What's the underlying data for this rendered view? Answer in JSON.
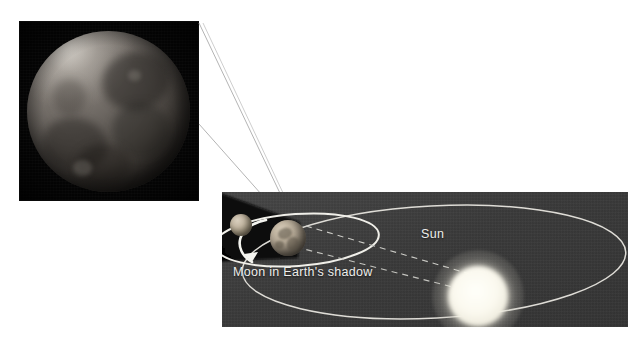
{
  "figure": {
    "background_color": "#ffffff"
  },
  "photo": {
    "name": "eclipsed-moon-photograph",
    "subject": "Moon during total lunar eclipse",
    "background_color": "#050505",
    "disc_color": "#6d675f",
    "alt_text": "Photograph of the Moon darkened inside Earth's shadow"
  },
  "leader_lines": {
    "name": "callout-leader-lines",
    "color": "#b9b9b9",
    "count": 2,
    "description": "Lines connecting the photograph to the Moon in Earth's shadow in the diagram"
  },
  "diagram": {
    "name": "orbit-diagram",
    "background_color": "#3b3b3b",
    "labels": [
      {
        "id": "sun",
        "text": "Sun",
        "color": "#ededea"
      },
      {
        "id": "moon-shadow",
        "text": "Moon in Earth's shadow",
        "color": "#ededea"
      }
    ],
    "bodies": [
      {
        "id": "sun",
        "name": "Sun",
        "color": "#fffff8",
        "kind": "star"
      },
      {
        "id": "earth",
        "name": "Earth",
        "color": "#c3b7a3",
        "kind": "planet"
      },
      {
        "id": "moon",
        "name": "Moon",
        "color": "#c6baa6",
        "kind": "satellite"
      }
    ],
    "orbits": [
      {
        "id": "earth-orbit",
        "name": "Earth's orbit around the Sun",
        "style": "solid",
        "color": "#e6e6e2"
      },
      {
        "id": "moon-orbit",
        "name": "Moon's orbit around Earth",
        "style": "solid",
        "color": "#f2f2ee"
      }
    ],
    "shadow": {
      "id": "earth-umbra",
      "name": "Earth's shadow cone",
      "color": "#0b0b0b",
      "description": "Dark cone extending from Earth away from the Sun, containing the Moon"
    },
    "rays": {
      "id": "sunlight-rays",
      "name": "Sunlight tangent rays",
      "style": "dashed",
      "color": "#cfcfcb",
      "count": 2
    },
    "direction_arrow": {
      "id": "moon-orbit-arrow",
      "name": "Moon orbital direction arrow",
      "color": "#f4f4f0"
    }
  }
}
